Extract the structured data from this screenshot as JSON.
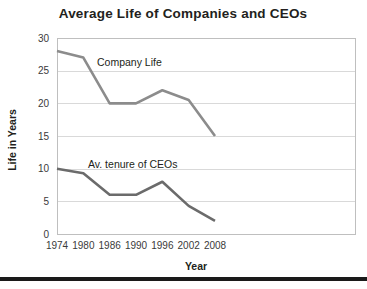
{
  "chart_data": {
    "type": "line",
    "title": "Average Life of Companies and CEOs",
    "xlabel": "Year",
    "ylabel": "Life in Years",
    "x": [
      1974,
      1980,
      1986,
      1990,
      1996,
      2002,
      2008
    ],
    "categories": [
      "1974",
      "1980",
      "1986",
      "1990",
      "1996",
      "2002",
      "2008"
    ],
    "xlim": [
      1974,
      2008
    ],
    "ylim": [
      0,
      30
    ],
    "yticks": [
      0,
      5,
      10,
      15,
      20,
      25,
      30
    ],
    "ytick_labels": [
      "0",
      "5",
      "10",
      "15",
      "20",
      "25",
      "30"
    ],
    "grid": "horizontal",
    "legend": "inline-annotations",
    "series": [
      {
        "name": "Company Life",
        "label": "Company Life",
        "color": "#8c8c8c",
        "line_width": 2.6,
        "values": [
          28,
          27,
          20,
          20,
          22,
          20.5,
          15
        ]
      },
      {
        "name": "Av. tenure of CEOs",
        "label": "Av. tenure of CEOs",
        "color": "#6b6b6b",
        "line_width": 2.6,
        "values": [
          10,
          9.3,
          6,
          6,
          8,
          4.3,
          2
        ]
      }
    ],
    "annotations": [
      {
        "text": "Company Life",
        "x_px": 97,
        "y_px": 66
      },
      {
        "text": "Av. tenure of CEOs",
        "x_px": 88,
        "y_px": 168
      }
    ]
  },
  "layout": {
    "plot_left_px": 57,
    "plot_right_px": 355,
    "plot_top_px": 38,
    "plot_bottom_px": 234,
    "data_right_px": 215,
    "title_x_px": 183,
    "title_y_px": 18,
    "ylabel_x_px": 16,
    "ylabel_y_px": 140,
    "xlabel_x_px": 196,
    "xlabel_y_px": 270,
    "tick_x_label_y_px": 249,
    "footer_rule_y_px": 277,
    "footer_rule_height_px": 4
  },
  "colors": {
    "background": "#ffffff",
    "text": "#231f20",
    "gridline": "#d9d9d9",
    "plot_border": "#bfbfbf",
    "series_primary": "#8c8c8c",
    "series_secondary": "#6b6b6b",
    "footer_rule": "#1a1a1a"
  }
}
